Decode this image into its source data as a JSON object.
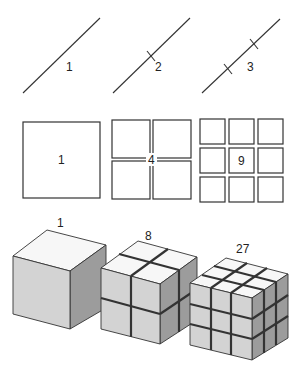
{
  "figure": {
    "rows": [
      {
        "name": "lines",
        "dimension": 1,
        "items": [
          {
            "label": "1",
            "segments": 1
          },
          {
            "label": "2",
            "segments": 2
          },
          {
            "label": "3",
            "segments": 3
          }
        ]
      },
      {
        "name": "squares",
        "dimension": 2,
        "items": [
          {
            "label": "1",
            "grid": 1
          },
          {
            "label": "4",
            "grid": 2
          },
          {
            "label": "9",
            "grid": 3
          }
        ]
      },
      {
        "name": "cubes",
        "dimension": 3,
        "items": [
          {
            "label": "1",
            "grid": 1
          },
          {
            "label": "8",
            "grid": 2
          },
          {
            "label": "27",
            "grid": 3
          }
        ]
      }
    ],
    "colors": {
      "stroke": "#333333",
      "cube_top": "#f7f7f7",
      "cube_front": "#d3d3d3",
      "cube_right": "#9c9c9c",
      "background": "#ffffff"
    }
  }
}
